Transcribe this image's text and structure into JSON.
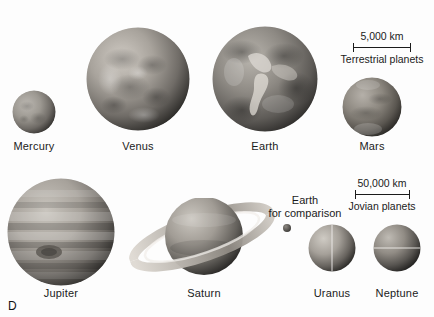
{
  "figure": {
    "panel_letter": "D",
    "background_color": "#fdfdfd",
    "text_color": "#1b1b1b"
  },
  "planets": [
    {
      "name": "Mercury",
      "label": "Mercury",
      "group": "terrestrial",
      "cx": 34,
      "cy": 112,
      "r": 22
    },
    {
      "name": "Venus",
      "label": "Venus",
      "group": "terrestrial",
      "cx": 138,
      "cy": 79,
      "r": 52
    },
    {
      "name": "Earth",
      "label": "Earth",
      "group": "terrestrial",
      "cx": 265,
      "cy": 79,
      "r": 53
    },
    {
      "name": "Mars",
      "label": "Mars",
      "group": "terrestrial",
      "cx": 372,
      "cy": 107,
      "r": 30
    },
    {
      "name": "Jupiter",
      "label": "Jupiter",
      "group": "jovian",
      "cx": 61,
      "cy": 232,
      "r": 54
    },
    {
      "name": "Saturn",
      "label": "Saturn",
      "group": "jovian",
      "cx": 204,
      "cy": 236,
      "r": 40
    },
    {
      "name": "Uranus",
      "label": "Uranus",
      "group": "jovian",
      "cx": 332,
      "cy": 248,
      "r": 22
    },
    {
      "name": "Neptune",
      "label": "Neptune",
      "group": "jovian",
      "cx": 397,
      "cy": 248,
      "r": 22
    }
  ],
  "annotations": {
    "earth_comparison": {
      "line1": "Earth",
      "line2": "for comparison",
      "dot_cx": 287,
      "dot_cy": 228,
      "dot_r": 4
    }
  },
  "scale_bars": [
    {
      "id": "terrestrial",
      "distance_label": "5,000 km",
      "group_label": "Terrestrial planets",
      "bar_left": 352,
      "bar_right": 410,
      "bar_y": 49
    },
    {
      "id": "jovian",
      "distance_label": "50,000 km",
      "group_label": "Jovian planets",
      "bar_left": 355,
      "bar_right": 410,
      "bar_y": 196
    }
  ]
}
